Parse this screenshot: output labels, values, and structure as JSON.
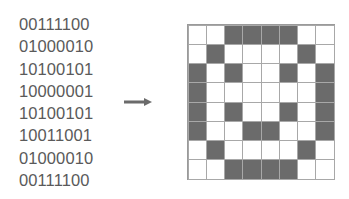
{
  "binary_rows": [
    "00111100",
    "01000010",
    "10100101",
    "10000001",
    "10100101",
    "10011001",
    "01000010",
    "00111100"
  ],
  "arrow": {
    "icon": "right-arrow-icon",
    "color": "#6b6b6b"
  },
  "pixel_grid": {
    "rows": 8,
    "cols": 8,
    "filled_color": "#6b6b6b",
    "empty_color": "#ffffff",
    "line_color": "#a8a8a8"
  }
}
